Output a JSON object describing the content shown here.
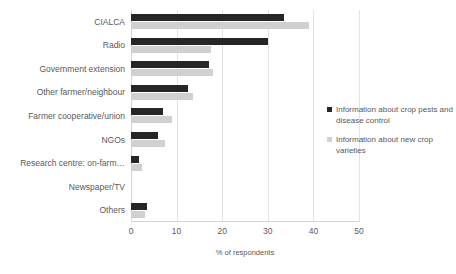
{
  "chart_data": {
    "type": "bar",
    "orientation": "horizontal",
    "title": "",
    "xlabel": "% of respondents",
    "ylabel": "",
    "xlim": [
      0,
      50
    ],
    "xticks": [
      0,
      10,
      20,
      30,
      40,
      50
    ],
    "grid": "vertical",
    "legend_position": "right",
    "categories": [
      "CIALCA",
      "Radio",
      "Government extension",
      "Other farmer/neighbour",
      "Farmer cooperative/union",
      "NGOs",
      "Research centre: on-farm…",
      "Newspaper/TV",
      "Others"
    ],
    "series": [
      {
        "name": "Information about crop pests and disease control",
        "color": "#262626",
        "values": [
          33.5,
          30,
          17,
          12.5,
          7,
          6,
          1.8,
          0,
          3.5
        ]
      },
      {
        "name": "Information about new crop varieties",
        "color": "#d0d0d0",
        "values": [
          39,
          17.5,
          18,
          13.5,
          9,
          7.5,
          2.5,
          0,
          3
        ]
      }
    ]
  },
  "legend": {
    "entries": [
      {
        "label": "Information about crop pests and disease control"
      },
      {
        "label": "Information about new crop varieties"
      }
    ]
  }
}
